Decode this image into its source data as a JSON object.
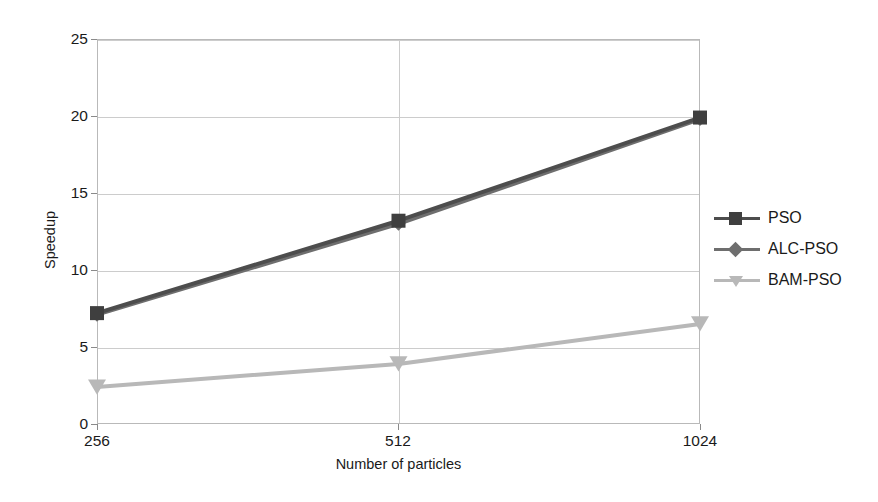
{
  "chart_data": {
    "type": "line",
    "title": "",
    "xlabel": "Number of particles",
    "ylabel": "Speedup",
    "categories": [
      "256",
      "512",
      "1024"
    ],
    "x_tick_labels": [
      "256",
      "512",
      "1024"
    ],
    "y_tick_labels": [
      "0",
      "5",
      "10",
      "15",
      "20",
      "25"
    ],
    "y_ticks": [
      0,
      5,
      10,
      15,
      20,
      25
    ],
    "ylim": [
      0,
      25
    ],
    "grid": true,
    "legend_position": "right",
    "series": [
      {
        "name": "PSO",
        "values": [
          7.2,
          13.2,
          19.9
        ],
        "color": "#4d4d4d",
        "marker": "square"
      },
      {
        "name": "ALC-PSO",
        "values": [
          7.1,
          13.0,
          19.8
        ],
        "color": "#6e6e6e",
        "marker": "diamond"
      },
      {
        "name": "BAM-PSO",
        "values": [
          2.4,
          3.9,
          6.5
        ],
        "color": "#b8b8b8",
        "marker": "triangle-down"
      }
    ]
  },
  "axes": {
    "y_title": "Speedup",
    "x_title": "Number of particles",
    "y_labels": [
      "25",
      "20",
      "15",
      "10",
      "5",
      "0"
    ],
    "x_labels": [
      "256",
      "512",
      "1024"
    ]
  },
  "legend": {
    "entries": [
      {
        "label": "PSO",
        "color": "#4d4d4d",
        "marker": "square"
      },
      {
        "label": "ALC-PSO",
        "color": "#6e6e6e",
        "marker": "diamond"
      },
      {
        "label": "BAM-PSO",
        "color": "#b8b8b8",
        "marker": "triangle-down"
      }
    ]
  },
  "colors": {
    "background": "#ffffff",
    "grid": "#cccccc",
    "frame": "#b9b9b9",
    "text": "#1a1a1a"
  }
}
